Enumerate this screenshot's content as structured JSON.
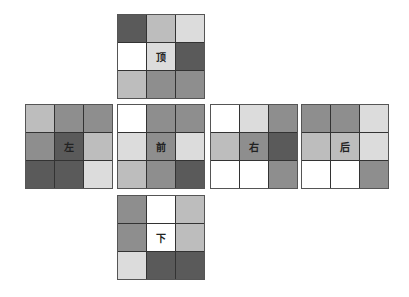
{
  "palette": {
    "white": "#ffffff",
    "light": "#dcdcdc",
    "midlight": "#bdbdbd",
    "mid": "#8e8e8e",
    "dark": "#5a5a5a"
  },
  "faces": {
    "top": {
      "label": "顶",
      "cells": [
        "dark",
        "midlight",
        "light",
        "white",
        "light",
        "dark",
        "midlight",
        "mid",
        "mid"
      ]
    },
    "left": {
      "label": "左",
      "cells": [
        "midlight",
        "mid",
        "mid",
        "mid",
        "dark",
        "midlight",
        "dark",
        "dark",
        "light"
      ]
    },
    "front": {
      "label": "前",
      "cells": [
        "white",
        "mid",
        "mid",
        "light",
        "mid",
        "light",
        "midlight",
        "mid",
        "dark"
      ]
    },
    "right": {
      "label": "右",
      "cells": [
        "white",
        "light",
        "mid",
        "midlight",
        "mid",
        "dark",
        "white",
        "white",
        "mid"
      ]
    },
    "back": {
      "label": "后",
      "cells": [
        "mid",
        "mid",
        "light",
        "midlight",
        "midlight",
        "light",
        "white",
        "white",
        "mid"
      ]
    },
    "bottom": {
      "label": "下",
      "cells": [
        "mid",
        "white",
        "midlight",
        "mid",
        "white",
        "midlight",
        "light",
        "dark",
        "dark"
      ]
    }
  }
}
